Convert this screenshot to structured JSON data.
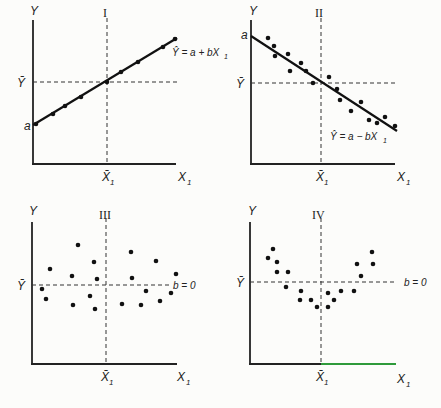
{
  "figure": {
    "panels": [
      {
        "id": "I",
        "numeral": "I",
        "y_label": "Y",
        "x_label": "X",
        "x_label_sub": "1",
        "mean_y_label": "Ȳ",
        "mean_x_label": "X̄",
        "mean_x_sub": "1",
        "intercept_label": "a",
        "equation": "Ŷ = a + bX",
        "equation_sub": "1",
        "relationship": "positive linear, points on line"
      },
      {
        "id": "II",
        "numeral": "II",
        "y_label": "Y",
        "x_label": "X",
        "x_label_sub": "1",
        "mean_y_label": "Ȳ",
        "mean_x_label": "X̄",
        "mean_x_sub": "1",
        "intercept_label": "a",
        "equation": "Ŷ = a − bX",
        "equation_sub": "1",
        "relationship": "negative linear, scattered around line"
      },
      {
        "id": "III",
        "numeral": "III",
        "y_label": "Y",
        "x_label": "X",
        "x_label_sub": "1",
        "mean_y_label": "Ȳ",
        "mean_x_label": "X̄",
        "mean_x_sub": "1",
        "slope_label": "b = 0",
        "relationship": "no relationship, random scatter"
      },
      {
        "id": "IV",
        "numeral": "IV",
        "y_label": "Y",
        "x_label": "X",
        "x_label_sub": "1",
        "mean_y_label": "Ȳ",
        "mean_x_label": "X̄",
        "mean_x_sub": "1",
        "slope_label": "b = 0",
        "relationship": "curvilinear (U-shaped), linear slope zero"
      }
    ]
  },
  "chart_data": [
    {
      "type": "scatter",
      "title": "I",
      "xlabel": "X1",
      "ylabel": "Y",
      "annotations": [
        "Ŷ = a + bX1",
        "a",
        "Ȳ",
        "X̄1"
      ],
      "grid": false,
      "regression_line": {
        "intercept_label": "a",
        "slope": "positive"
      },
      "points_px": [
        [
          36,
          124
        ],
        [
          53,
          114
        ],
        [
          65,
          106
        ],
        [
          81,
          97
        ],
        [
          107,
          82
        ],
        [
          121,
          72
        ],
        [
          138,
          62
        ],
        [
          163,
          47
        ],
        [
          175,
          39
        ]
      ],
      "line_px": [
        [
          33,
          125
        ],
        [
          177,
          38
        ]
      ],
      "axes_px": {
        "origin": [
          33,
          164
        ],
        "x_end": 176,
        "y_top": 20,
        "mean_x": 107,
        "mean_y": 82
      }
    },
    {
      "type": "scatter",
      "title": "II",
      "xlabel": "X1",
      "ylabel": "Y",
      "annotations": [
        "Ŷ = a − bX1",
        "a",
        "Ȳ",
        "X̄1"
      ],
      "grid": false,
      "regression_line": {
        "intercept_label": "a",
        "slope": "negative"
      },
      "points_px": [
        [
          268,
          38
        ],
        [
          274,
          46
        ],
        [
          275,
          56
        ],
        [
          288,
          54
        ],
        [
          290,
          71
        ],
        [
          301,
          63
        ],
        [
          306,
          71
        ],
        [
          313,
          83
        ],
        [
          329,
          77
        ],
        [
          337,
          89
        ],
        [
          340,
          100
        ],
        [
          351,
          111
        ],
        [
          361,
          102
        ],
        [
          369,
          120
        ],
        [
          377,
          123
        ],
        [
          385,
          117
        ],
        [
          395,
          126
        ]
      ],
      "line_px": [
        [
          251,
          36
        ],
        [
          397,
          131
        ]
      ],
      "axes_px": {
        "origin": [
          251,
          164
        ],
        "x_end": 395,
        "y_top": 20,
        "mean_x": 321,
        "mean_y": 83
      }
    },
    {
      "type": "scatter",
      "title": "III",
      "xlabel": "X1",
      "ylabel": "Y",
      "annotations": [
        "b = 0",
        "Ȳ",
        "X̄1"
      ],
      "grid": false,
      "points_px": [
        [
          42,
          289
        ],
        [
          46,
          299
        ],
        [
          50,
          269
        ],
        [
          73,
          305
        ],
        [
          72,
          276
        ],
        [
          78,
          245
        ],
        [
          94,
          262
        ],
        [
          97,
          279
        ],
        [
          90,
          296
        ],
        [
          95,
          309
        ],
        [
          122,
          304
        ],
        [
          131,
          252
        ],
        [
          132,
          278
        ],
        [
          141,
          305
        ],
        [
          146,
          291
        ],
        [
          156,
          261
        ],
        [
          160,
          301
        ],
        [
          171,
          293
        ],
        [
          176,
          274
        ]
      ],
      "axes_px": {
        "origin": [
          32,
          364
        ],
        "x_end": 177,
        "y_top": 222,
        "mean_x": 106,
        "mean_y": 285
      }
    },
    {
      "type": "scatter",
      "title": "IV",
      "xlabel": "X1",
      "ylabel": "Y",
      "annotations": [
        "b = 0",
        "Ȳ",
        "X̄1"
      ],
      "grid": false,
      "points_px": [
        [
          268,
          258
        ],
        [
          273,
          249
        ],
        [
          277,
          262
        ],
        [
          277,
          272
        ],
        [
          288,
          272
        ],
        [
          286,
          287
        ],
        [
          301,
          291
        ],
        [
          300,
          300
        ],
        [
          311,
          300
        ],
        [
          317,
          307
        ],
        [
          328,
          293
        ],
        [
          328,
          307
        ],
        [
          334,
          300
        ],
        [
          341,
          291
        ],
        [
          354,
          291
        ],
        [
          357,
          264
        ],
        [
          361,
          276
        ],
        [
          372,
          252
        ],
        [
          373,
          264
        ]
      ],
      "axes_px": {
        "origin": [
          250,
          364
        ],
        "x_end": 396,
        "y_top": 222,
        "mean_x": 321,
        "mean_y": 282
      }
    }
  ]
}
